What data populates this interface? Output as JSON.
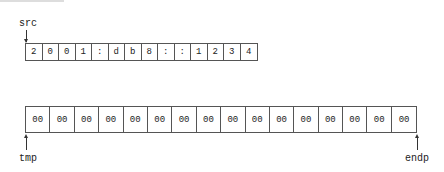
{
  "diagram": {
    "pointers": {
      "src": "src",
      "tmp": "tmp",
      "endp": "endp"
    },
    "src_array": {
      "cells": [
        "2",
        "0",
        "0",
        "1",
        ":",
        "d",
        "b",
        "8",
        ":",
        ":",
        "1",
        "2",
        "3",
        "4"
      ]
    },
    "tmp_array": {
      "cells": [
        "00",
        "00",
        "00",
        "00",
        "00",
        "00",
        "00",
        "00",
        "00",
        "00",
        "00",
        "00",
        "00",
        "00",
        "00",
        "00"
      ]
    }
  }
}
